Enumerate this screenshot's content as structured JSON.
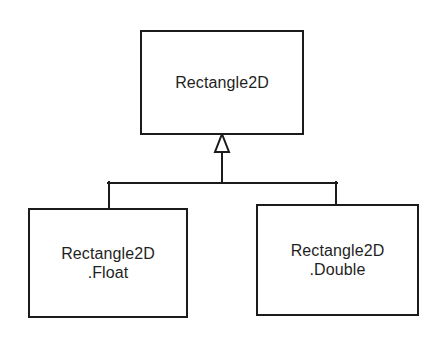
{
  "diagram": {
    "type": "uml-class-diagram",
    "background_color": "#ffffff",
    "stroke_color": "#1b1b1b",
    "text_color": "#1f1f1f",
    "superclass": {
      "name": "Rectangle2D"
    },
    "subclasses": [
      {
        "name_line1": "Rectangle2D",
        "name_line2": ".Float"
      },
      {
        "name_line1": "Rectangle2D",
        "name_line2": ".Double"
      }
    ],
    "relationship": {
      "kind": "generalization",
      "arrowhead": "hollow-triangle"
    }
  }
}
